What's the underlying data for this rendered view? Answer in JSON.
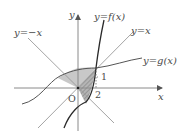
{
  "diagram": {
    "axes": {
      "x_label": "x",
      "y_label": "y",
      "origin_label": "O"
    },
    "curves": {
      "f": "y=f(x)",
      "identity": "y=x",
      "neg_identity": "y=−x",
      "g": "y=g(x)"
    },
    "marks": {
      "one": "1",
      "two": "2"
    },
    "colors": {
      "shade_light": "#c8c8c8",
      "shade_dark": "#9a9a9a",
      "line": "#8a8a8a",
      "curve": "#2a2a2a"
    }
  }
}
